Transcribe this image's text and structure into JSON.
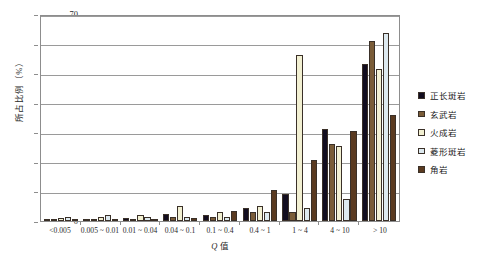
{
  "chart_data": {
    "type": "bar",
    "title": "",
    "xlabel": "Q 值",
    "ylabel": "所占比例（%）",
    "ylim": [
      0,
      70
    ],
    "yticks": [
      0,
      10,
      20,
      30,
      40,
      50,
      60,
      70
    ],
    "grid": true,
    "legend_position": "right",
    "categories": [
      "<0.005",
      "0.005 ~ 0.01",
      "0.01 ~ 0.04",
      "0.04 ~ 0.1",
      "0.1 ~ 0.4",
      "0.4 ~ 1",
      "1 ~ 4",
      "4 ~ 10",
      "> 10"
    ],
    "series": [
      {
        "name": "正长斑岩",
        "color": "#120d1f",
        "values": [
          0.4,
          0.3,
          1.0,
          2.5,
          2.2,
          4.5,
          9.0,
          31.0,
          53.0
        ]
      },
      {
        "name": "玄武岩",
        "color": "#7a5c38",
        "values": [
          0.3,
          0.3,
          0.8,
          1.2,
          1.3,
          3.0,
          3.0,
          26.0,
          61.0
        ]
      },
      {
        "name": "火成岩",
        "color": "#f2f0d2",
        "values": [
          1.0,
          1.5,
          2.0,
          5.0,
          3.0,
          5.0,
          56.0,
          25.5,
          51.5
        ]
      },
      {
        "name": "菱形斑岩",
        "color": "#dde9ef",
        "values": [
          1.3,
          2.0,
          1.2,
          1.5,
          1.5,
          3.0,
          4.5,
          7.5,
          63.5
        ]
      },
      {
        "name": "角岩",
        "color": "#5a3a20",
        "values": [
          0.2,
          0.5,
          0.8,
          1.0,
          3.5,
          10.5,
          20.5,
          30.5,
          36.0
        ]
      }
    ]
  },
  "legend": {
    "items": [
      {
        "label": "正长斑岩",
        "color": "#120d1f"
      },
      {
        "label": "玄武岩",
        "color": "#7a5c38"
      },
      {
        "label": "火成岩",
        "color": "#f2f0d2"
      },
      {
        "label": "菱形斑岩",
        "color": "#dde9ef"
      },
      {
        "label": "角岩",
        "color": "#5a3a20"
      }
    ]
  },
  "axes": {
    "y_title": "所占比例（%）",
    "x_title_symbol": "Q",
    "x_title_rest": " 值"
  }
}
